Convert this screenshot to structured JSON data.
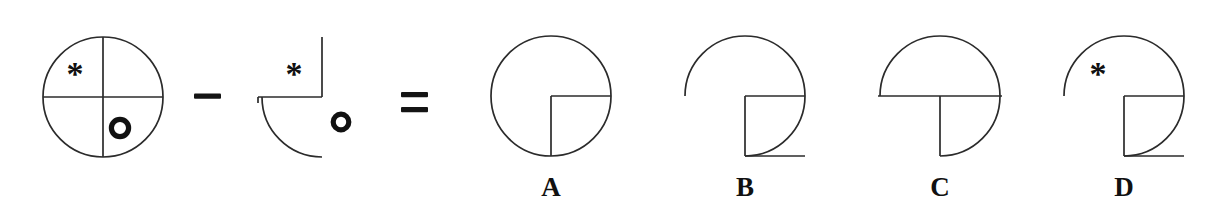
{
  "puzzle": {
    "type": "figure-subtraction",
    "canvas": {
      "width": 1205,
      "height": 211,
      "background": "#ffffff"
    },
    "stroke_color": "#2b2b2b",
    "label_color": "#111111",
    "operators": [
      {
        "name": "minus",
        "glyph": "−",
        "x": 207,
        "y": 97
      },
      {
        "name": "equals",
        "glyph": "=",
        "x": 414,
        "y": 105
      }
    ],
    "operands": [
      {
        "id": "minuend",
        "description": "Full circle divided into four quadrants by a vertical and a horizontal diameter",
        "center": {
          "x": 103,
          "y": 97
        },
        "radius": 60,
        "arcs": [
          "full-circle"
        ],
        "lines": [
          "vertical-diameter",
          "horizontal-diameter"
        ],
        "markers": [
          {
            "kind": "asterisk",
            "glyph": "*",
            "x": 75,
            "y": 74,
            "size": 30,
            "quadrant": "upper-left"
          },
          {
            "kind": "ring",
            "glyph": "○",
            "x": 120,
            "y": 128,
            "radius": 9,
            "quadrant": "lower-right"
          }
        ]
      },
      {
        "id": "subtrahend",
        "description": "Lower-left quadrant arc with radius lines up and left; asterisk inside, ring detached outside",
        "center": {
          "x": 322,
          "y": 97
        },
        "radius": 60,
        "arcs": [
          "lower-left-quadrant"
        ],
        "lines": [
          "radius-up",
          "radius-left"
        ],
        "markers": [
          {
            "kind": "asterisk",
            "glyph": "*",
            "x": 294,
            "y": 74,
            "size": 30,
            "quadrant": "upper-left"
          },
          {
            "kind": "ring",
            "glyph": "○",
            "x": 341,
            "y": 122,
            "radius": 8,
            "quadrant": "outside-right"
          }
        ]
      }
    ],
    "options": [
      {
        "id": "A",
        "label": "A",
        "description": "Complete circle with radius lines up and left from the lower-right quadrant corner",
        "center": {
          "x": 551,
          "y": 96
        },
        "radius": 60,
        "arcs": [
          "full-circle"
        ],
        "lines": [
          "radius-right",
          "radius-down"
        ],
        "markers": [],
        "label_x": 551,
        "label_y": 196
      },
      {
        "id": "B",
        "label": "B",
        "description": "Arc covering three quadrants (missing lower-left) with radius lines right and down",
        "center": {
          "x": 745,
          "y": 96
        },
        "radius": 60,
        "arcs": [
          "missing-lower-left-quadrant"
        ],
        "lines": [
          "radius-right",
          "radius-down"
        ],
        "markers": [],
        "label_x": 745,
        "label_y": 196
      },
      {
        "id": "C",
        "label": "C",
        "description": "Upper half-circle plus lower-right quadrant arc, full horizontal diameter and radius down",
        "center": {
          "x": 940,
          "y": 96
        },
        "radius": 60,
        "arcs": [
          "upper-half-and-lower-right-quadrant"
        ],
        "lines": [
          "horizontal-diameter",
          "radius-down"
        ],
        "markers": [],
        "label_x": 940,
        "label_y": 196
      },
      {
        "id": "D",
        "label": "D",
        "description": "Arc covering three quadrants (missing lower-left) with radius lines right and down and an asterisk",
        "center": {
          "x": 1124,
          "y": 96
        },
        "radius": 60,
        "arcs": [
          "missing-lower-left-quadrant"
        ],
        "lines": [
          "radius-right",
          "radius-down"
        ],
        "markers": [
          {
            "kind": "asterisk",
            "glyph": "*",
            "x": 1098,
            "y": 74,
            "size": 30,
            "quadrant": "upper-left"
          }
        ],
        "label_x": 1124,
        "label_y": 196
      }
    ]
  }
}
